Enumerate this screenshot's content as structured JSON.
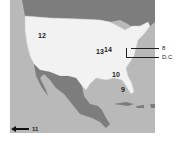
{
  "map": {
    "region": "United States",
    "colors": {
      "land_us": "#f2f2f2",
      "land_other": "#7d7d7d",
      "water": "#b9b9b9",
      "borders": "#cfcfcf"
    },
    "labels": [
      {
        "id": "12",
        "text": "12"
      },
      {
        "id": "13",
        "text": "13"
      },
      {
        "id": "14",
        "text": "14"
      },
      {
        "id": "10",
        "text": "10"
      },
      {
        "id": "9",
        "text": "9"
      }
    ],
    "callouts": [
      {
        "id": "8",
        "text": "8"
      },
      {
        "id": "dc",
        "text": "D.C"
      }
    ],
    "arrow": {
      "text": "11",
      "direction": "left"
    }
  }
}
